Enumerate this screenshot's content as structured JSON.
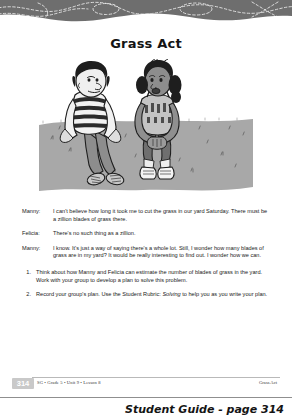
{
  "header": {
    "band_color": "#6e6e6e",
    "squiggle_color": "#e8e8e8"
  },
  "title": "Grass Act",
  "illustration": {
    "name": "two-children-sitting-on-grass",
    "alt": "Two kids, a boy in a striped shirt and a girl in a tank top, sitting on a lawn talking",
    "ground_color": "#a9a9a9",
    "ink_color": "#1e1e1e"
  },
  "dialogue": [
    {
      "speaker": "Manny:",
      "text": "I can't believe how long it took me to cut the grass in our yard Saturday. There must be a zillion blades of grass there."
    },
    {
      "speaker": "Felicia:",
      "text": "There's no such thing as a zillion."
    },
    {
      "speaker": "Manny:",
      "text": "I know. It's just a way of saying there's a whole lot. Still, I wonder how many blades of grass are in my yard? It would be really interesting to find out. I wonder how we can."
    }
  ],
  "tasks": [
    {
      "number": "1.",
      "text_before": "Think about how Manny and Felicia can estimate the number of blades of grass in the yard. Work with your group to develop a plan to solve this problem.",
      "italic": "",
      "text_after": ""
    },
    {
      "number": "2.",
      "text_before": "Record your group's plan. Use the Student Rubric: ",
      "italic": "Solving",
      "text_after": " to help you as you write your plan."
    }
  ],
  "footer": {
    "page_number": "314",
    "left": "SG • Grade 5 • Unit 9 • Lesson 8",
    "right": "Grass Act"
  },
  "caption": "Student Guide - page 314"
}
